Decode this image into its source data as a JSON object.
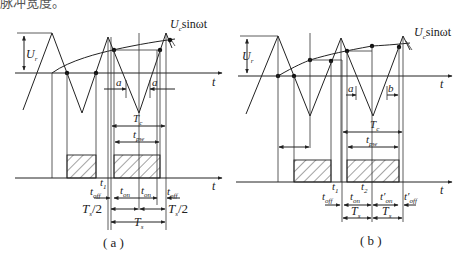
{
  "header_fragment": "脉冲宽度。",
  "panels": [
    {
      "id": "a",
      "caption": "( a )",
      "labels": {
        "amplitude": "U",
        "amplitude_sub": "r",
        "sine": "U",
        "sine_sub": "c",
        "sine_rest": "sinωt",
        "t_axis_top": "t",
        "t_axis_bottom": "t",
        "a_left": "a",
        "a_right": "a",
        "period": "T",
        "period_sub": "c",
        "pulse": "t",
        "pulse_sub": "pw",
        "t1": "t",
        "t1_sub": "1",
        "toff_left": "t",
        "toff_left_sub": "off",
        "ton_left": "t",
        "ton_left_sub": "on",
        "ton_right": "t",
        "ton_right_sub": "on",
        "toff_right": "t",
        "toff_right_sub": "off",
        "half_left": "T",
        "half_left_sub": "s",
        "half_left_rest": "/2",
        "half_right": "T",
        "half_right_sub": "s",
        "half_right_rest": "/2",
        "ts": "T",
        "ts_sub": "s"
      }
    },
    {
      "id": "b",
      "caption": "( b )",
      "labels": {
        "amplitude": "U",
        "amplitude_sub": "r",
        "sine": "U",
        "sine_sub": "c",
        "sine_rest": "sinωt",
        "t_axis_top": "t",
        "t_axis_bottom": "t",
        "a_left": "a",
        "b_right": "b",
        "period": "T",
        "period_sub": "c",
        "pulse": "t",
        "pulse_sub": "pw",
        "t1": "t",
        "t1_sub": "1",
        "t2": "t",
        "t2_sub": "2",
        "toff_left": "t",
        "toff_left_sub": "off",
        "ton_left": "t",
        "ton_left_sub": "on",
        "ton_right": "t′",
        "ton_right_sub": "on",
        "toff_right": "t′",
        "toff_right_sub": "off",
        "ts_left": "T",
        "ts_left_sub": "s",
        "ts_right": "T",
        "ts_right_sub": "s"
      }
    }
  ],
  "colors": {
    "ink": "#222222",
    "background": "#ffffff"
  }
}
